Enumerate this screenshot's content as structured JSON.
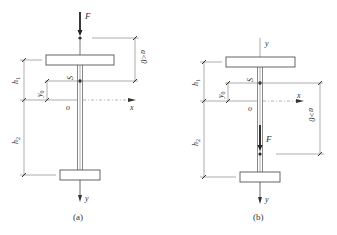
{
  "figure": {
    "type": "structural-diagram",
    "panels": [
      {
        "id": "a",
        "caption": "(a)",
        "labels": {
          "force": "F",
          "shear_center": "S",
          "origin": "o",
          "x_axis": "x",
          "y_axis": "y",
          "h1": "h",
          "h1_sub": "1",
          "h2": "h",
          "h2_sub": "2",
          "y0": "y",
          "y0_sub": "0",
          "a_dim": "a<0"
        },
        "notes": "Load F applied above the shear center (on top flange side)"
      },
      {
        "id": "b",
        "caption": "(b)",
        "labels": {
          "force": "F",
          "shear_center": "S",
          "origin": "o",
          "x_axis": "x",
          "y_axis": "y",
          "y_axis_top": "y",
          "h1": "h",
          "h1_sub": "1",
          "h2": "h",
          "h2_sub": "2",
          "y0": "y",
          "y0_sub": "0",
          "a_dim": "a>0"
        },
        "notes": "Load F applied below the shear center (toward bottom flange)"
      }
    ],
    "colors": {
      "line": "#555555",
      "force": "#222222",
      "text": "#333333",
      "background": "#ffffff"
    }
  }
}
